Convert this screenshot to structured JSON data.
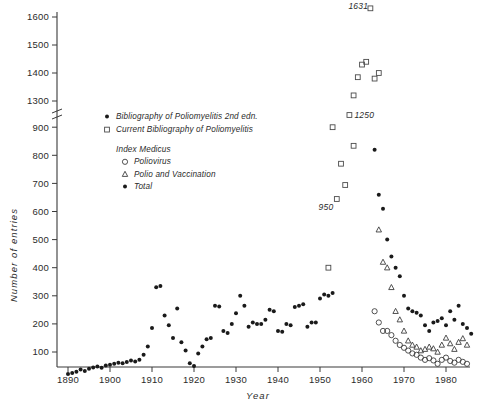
{
  "chart_data": {
    "type": "scatter",
    "title": "",
    "xlabel": "Year",
    "ylabel": "Number of entries",
    "xlim": [
      1887,
      1987
    ],
    "ylim": [
      0,
      1600
    ],
    "grid": false,
    "axis_break": {
      "present": true,
      "below": 900,
      "above": 1300
    },
    "xticks": [
      1890,
      1900,
      1910,
      1920,
      1930,
      1940,
      1950,
      1960,
      1970,
      1980
    ],
    "yticks": [
      100,
      200,
      300,
      400,
      500,
      600,
      700,
      800,
      900,
      1300,
      1400,
      1500,
      1600
    ],
    "legend_position": "upper-left-inside",
    "annotations": [
      {
        "text": "1631",
        "x": 1962,
        "y": 1631
      },
      {
        "text": "1250",
        "x": 1957,
        "y": 1250
      },
      {
        "text": "950",
        "x": 1953,
        "y": 950
      }
    ],
    "series": [
      {
        "name": "Bibliography of Poliomyelitis 2nd edn.",
        "marker": "filled-circle",
        "points": [
          [
            1890,
            22
          ],
          [
            1891,
            25
          ],
          [
            1892,
            30
          ],
          [
            1893,
            38
          ],
          [
            1894,
            32
          ],
          [
            1895,
            40
          ],
          [
            1896,
            45
          ],
          [
            1897,
            48
          ],
          [
            1898,
            44
          ],
          [
            1899,
            52
          ],
          [
            1900,
            55
          ],
          [
            1901,
            58
          ],
          [
            1902,
            62
          ],
          [
            1903,
            60
          ],
          [
            1904,
            64
          ],
          [
            1905,
            70
          ],
          [
            1906,
            66
          ],
          [
            1907,
            72
          ],
          [
            1908,
            90
          ],
          [
            1909,
            120
          ],
          [
            1910,
            185
          ],
          [
            1911,
            330
          ],
          [
            1912,
            335
          ],
          [
            1913,
            230
          ],
          [
            1914,
            195
          ],
          [
            1915,
            150
          ],
          [
            1916,
            255
          ],
          [
            1917,
            135
          ],
          [
            1918,
            105
          ],
          [
            1919,
            60
          ],
          [
            1920,
            50
          ],
          [
            1921,
            95
          ],
          [
            1922,
            120
          ],
          [
            1923,
            145
          ],
          [
            1924,
            150
          ],
          [
            1925,
            265
          ],
          [
            1926,
            262
          ],
          [
            1927,
            175
          ],
          [
            1928,
            168
          ],
          [
            1929,
            200
          ],
          [
            1930,
            238
          ],
          [
            1931,
            300
          ],
          [
            1932,
            265
          ],
          [
            1933,
            190
          ],
          [
            1934,
            205
          ],
          [
            1935,
            200
          ],
          [
            1936,
            200
          ],
          [
            1937,
            215
          ],
          [
            1938,
            250
          ],
          [
            1939,
            245
          ],
          [
            1940,
            175
          ],
          [
            1941,
            172
          ],
          [
            1942,
            200
          ],
          [
            1943,
            195
          ],
          [
            1944,
            260
          ],
          [
            1945,
            265
          ],
          [
            1946,
            270
          ],
          [
            1947,
            190
          ],
          [
            1948,
            205
          ],
          [
            1949,
            205
          ],
          [
            1950,
            290
          ],
          [
            1951,
            305
          ],
          [
            1952,
            300
          ],
          [
            1953,
            310
          ]
        ]
      },
      {
        "name": "Current Bibliography of Poliomyelitis",
        "marker": "open-square",
        "points": [
          [
            1952,
            400
          ],
          [
            1953,
            900
          ],
          [
            1954,
            950
          ],
          [
            1956,
            1000
          ],
          [
            1957,
            1250
          ],
          [
            1958,
            1320
          ],
          [
            1959,
            1385
          ],
          [
            1960,
            1430
          ],
          [
            1961,
            1440
          ],
          [
            1962,
            1631
          ],
          [
            1963,
            1380
          ],
          [
            1964,
            1400
          ],
          [
            1955,
            770
          ],
          [
            1958,
            1140
          ]
        ]
      },
      {
        "name": "Index Medicus - Poliovirus",
        "marker": "open-circle",
        "points": [
          [
            1963,
            245
          ],
          [
            1964,
            205
          ],
          [
            1965,
            175
          ],
          [
            1966,
            175
          ],
          [
            1967,
            160
          ],
          [
            1968,
            140
          ],
          [
            1969,
            125
          ],
          [
            1970,
            115
          ],
          [
            1971,
            105
          ],
          [
            1972,
            95
          ],
          [
            1973,
            90
          ],
          [
            1974,
            80
          ],
          [
            1975,
            72
          ],
          [
            1976,
            78
          ],
          [
            1977,
            70
          ],
          [
            1978,
            58
          ],
          [
            1979,
            72
          ],
          [
            1980,
            80
          ],
          [
            1981,
            68
          ],
          [
            1982,
            62
          ],
          [
            1983,
            72
          ],
          [
            1984,
            65
          ],
          [
            1985,
            58
          ]
        ]
      },
      {
        "name": "Index Medicus - Polio and Vaccination",
        "marker": "open-triangle",
        "points": [
          [
            1964,
            535
          ],
          [
            1965,
            420
          ],
          [
            1966,
            400
          ],
          [
            1967,
            330
          ],
          [
            1968,
            245
          ],
          [
            1969,
            215
          ],
          [
            1970,
            175
          ],
          [
            1971,
            140
          ],
          [
            1972,
            125
          ],
          [
            1973,
            118
          ],
          [
            1974,
            105
          ],
          [
            1975,
            110
          ],
          [
            1976,
            118
          ],
          [
            1977,
            112
          ],
          [
            1978,
            100
          ],
          [
            1979,
            125
          ],
          [
            1980,
            150
          ],
          [
            1981,
            130
          ],
          [
            1982,
            110
          ],
          [
            1983,
            135
          ],
          [
            1984,
            148
          ],
          [
            1985,
            125
          ]
        ]
      },
      {
        "name": "Index Medicus - Total",
        "marker": "filled-circle-late",
        "points": [
          [
            1963,
            820
          ],
          [
            1964,
            660
          ],
          [
            1965,
            610
          ],
          [
            1966,
            500
          ],
          [
            1967,
            440
          ],
          [
            1968,
            400
          ],
          [
            1969,
            370
          ],
          [
            1970,
            300
          ],
          [
            1971,
            255
          ],
          [
            1972,
            245
          ],
          [
            1973,
            240
          ],
          [
            1974,
            230
          ],
          [
            1975,
            195
          ],
          [
            1976,
            175
          ],
          [
            1977,
            205
          ],
          [
            1978,
            210
          ],
          [
            1979,
            220
          ],
          [
            1980,
            195
          ],
          [
            1981,
            245
          ],
          [
            1982,
            215
          ],
          [
            1983,
            265
          ],
          [
            1984,
            200
          ],
          [
            1985,
            185
          ],
          [
            1986,
            165
          ]
        ]
      }
    ]
  },
  "legend": {
    "entries": [
      {
        "marker": "filled-circle",
        "label": "Bibliography of Poliomyelitis  2nd edn."
      },
      {
        "marker": "open-square",
        "label": "Current Bibliography of Poliomyelitis"
      }
    ],
    "group_title": "Index Medicus",
    "sub_entries": [
      {
        "marker": "open-circle",
        "label": "Poliovirus"
      },
      {
        "marker": "open-triangle",
        "label": "Polio and Vaccination"
      },
      {
        "marker": "filled-circle",
        "label": "Total"
      }
    ]
  },
  "colors": {
    "axis": "#3a3a3a",
    "text": "#2b2b2b",
    "marker_filled": "#1a1a1a",
    "marker_open": "#3d3d3d",
    "background": "#ffffff"
  }
}
